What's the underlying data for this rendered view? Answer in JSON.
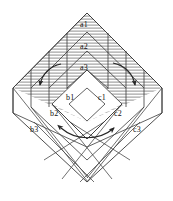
{
  "figure": {
    "background_color": "#ffffff",
    "line_color": "#3a3a3a",
    "hatch_color": "#8c8c8c",
    "label_color": "#111111",
    "width": 173,
    "height": 201
  },
  "labels": [
    {
      "id": "a1",
      "text": "a1",
      "x": 80,
      "y": 21
    },
    {
      "id": "a2",
      "text": "a2",
      "x": 80,
      "y": 43
    },
    {
      "id": "a3",
      "text": "a3",
      "x": 80,
      "y": 64
    },
    {
      "id": "b1",
      "text": "b1",
      "x": 66,
      "y": 94
    },
    {
      "id": "c1",
      "text": "c1",
      "x": 98,
      "y": 94
    },
    {
      "id": "b2",
      "text": "b2",
      "x": 50,
      "y": 110
    },
    {
      "id": "c2",
      "text": "c2",
      "x": 114,
      "y": 110
    },
    {
      "id": "b3",
      "text": "b3",
      "x": 30,
      "y": 126
    },
    {
      "id": "c3",
      "text": "c3",
      "x": 133,
      "y": 126
    }
  ],
  "arrows": [
    {
      "id": "left-rotation-arrow",
      "direction": "down-left",
      "heads": 1
    },
    {
      "id": "right-rotation-arrow",
      "direction": "down-right",
      "heads": 1
    },
    {
      "id": "bottom-exchange-arrow",
      "direction": "bidirectional",
      "heads": 2
    }
  ],
  "regions": [
    {
      "id": "upper-hatched-region",
      "fill": "horizontal-hatch"
    },
    {
      "id": "lower-grid-region",
      "fill": "none"
    }
  ]
}
